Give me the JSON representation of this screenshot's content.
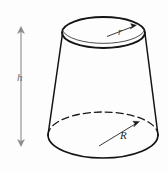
{
  "figure": {
    "shape": "truncated-cone-frustum",
    "background_color": "#fdfdfd",
    "outline_color": "#1a1a1a",
    "dimension_arrow_color": "#8a8a8a",
    "radius_leader_color": "#3a3a3a",
    "labels": {
      "height": "h",
      "top_radius": "r",
      "bottom_radius": "R"
    },
    "geometry": {
      "top_ellipse": {
        "cx": 103.5,
        "cy": 32.5,
        "rx": 41.5,
        "ry": 15.5
      },
      "bottom_ellipse": {
        "cx": 103.0,
        "cy": 135.0,
        "rx": 55.0,
        "ry": 23.0
      },
      "left_side": {
        "x1": 62.0,
        "y1": 33.0,
        "x2": 48.0,
        "y2": 135.0
      },
      "right_side": {
        "x1": 145.0,
        "y1": 33.0,
        "x2": 158.0,
        "y2": 135.0
      },
      "height_arrow": {
        "x": 21.0,
        "y_top": 27.0,
        "y_bottom": 146.0
      },
      "top_radius_leader": {
        "x1": 108.0,
        "y1": 36.0,
        "x2": 134.0,
        "y2": 26.0
      },
      "bottom_radius_leader": {
        "x1": 100.0,
        "y1": 145.0,
        "x2": 139.0,
        "y2": 122.0
      }
    }
  }
}
